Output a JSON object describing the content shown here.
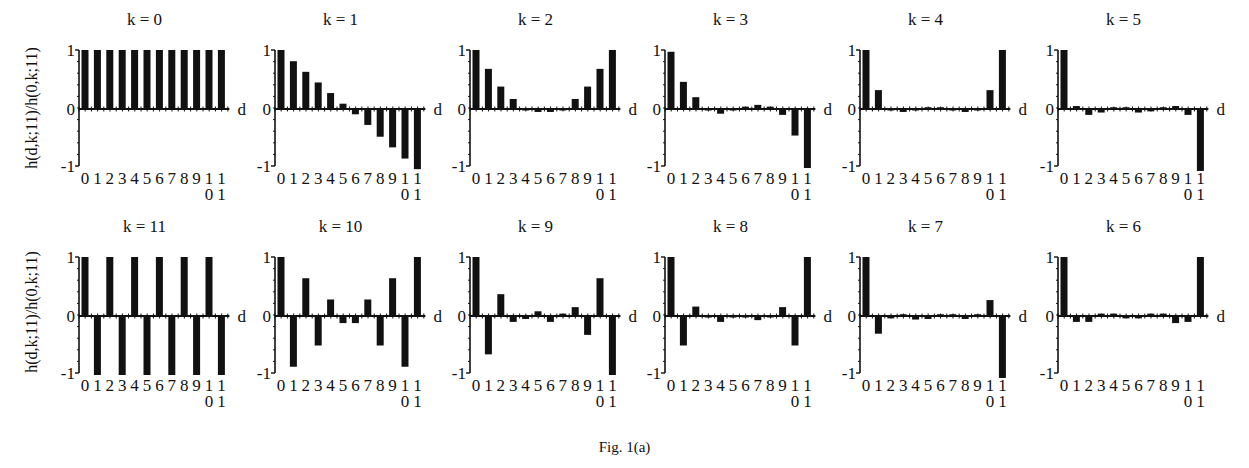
{
  "figure": {
    "caption": "Fig. 1(a)",
    "ylabel": "h(d,k;11)/h(0,k;11)",
    "xlabel": "d",
    "ytick_labels": [
      "1",
      "0",
      "-1"
    ],
    "xtick_line1": "0123456789",
    "xtick_tail_top": "11",
    "xtick_tail_bottom": "01"
  },
  "chart_data": [
    {
      "type": "bar",
      "title": "k = 0",
      "x": [
        0,
        1,
        2,
        3,
        4,
        5,
        6,
        7,
        8,
        9,
        10,
        11
      ],
      "values": [
        1,
        1,
        1,
        1,
        1,
        1,
        1,
        1,
        1,
        1,
        1,
        1
      ],
      "xlabel": "d",
      "ylabel": "h(d,k;11)/h(0,k;11)",
      "ylim": [
        -1,
        1
      ]
    },
    {
      "type": "bar",
      "title": "k = 1",
      "x": [
        0,
        1,
        2,
        3,
        4,
        5,
        6,
        7,
        8,
        9,
        10,
        11
      ],
      "values": [
        1,
        0.81,
        0.63,
        0.45,
        0.27,
        0.09,
        -0.09,
        -0.27,
        -0.47,
        -0.65,
        -0.84,
        -1.02
      ],
      "xlabel": "d",
      "ylim": [
        -1,
        1
      ]
    },
    {
      "type": "bar",
      "title": "k = 2",
      "x": [
        0,
        1,
        2,
        3,
        4,
        5,
        6,
        7,
        8,
        9,
        10,
        11
      ],
      "values": [
        1,
        0.68,
        0.38,
        0.17,
        0,
        -0.05,
        -0.05,
        0,
        0.17,
        0.38,
        0.68,
        1
      ],
      "xlabel": "d",
      "ylim": [
        -1,
        1
      ]
    },
    {
      "type": "bar",
      "title": "k = 3",
      "x": [
        0,
        1,
        2,
        3,
        4,
        5,
        6,
        7,
        8,
        9,
        10,
        11
      ],
      "values": [
        0.97,
        0.46,
        0.2,
        0,
        -0.08,
        0,
        0.04,
        0.07,
        0.04,
        -0.1,
        -0.45,
        -1
      ],
      "xlabel": "d",
      "ylim": [
        -1,
        1
      ]
    },
    {
      "type": "bar",
      "title": "k = 4",
      "x": [
        0,
        1,
        2,
        3,
        4,
        5,
        6,
        7,
        8,
        9,
        10,
        11
      ],
      "values": [
        1,
        0.32,
        0,
        -0.05,
        0,
        0.03,
        0.03,
        0,
        -0.05,
        0,
        0.32,
        1
      ],
      "xlabel": "d",
      "ylim": [
        -1,
        1
      ]
    },
    {
      "type": "bar",
      "title": "k = 5",
      "x": [
        0,
        1,
        2,
        3,
        4,
        5,
        6,
        7,
        8,
        9,
        10,
        11
      ],
      "values": [
        1,
        0.05,
        -0.1,
        -0.06,
        0.03,
        0.03,
        -0.06,
        -0.04,
        0.03,
        0.05,
        -0.1,
        -1.05
      ],
      "xlabel": "d",
      "ylim": [
        -1,
        1
      ]
    },
    {
      "type": "bar",
      "title": "k = 11",
      "x": [
        0,
        1,
        2,
        3,
        4,
        5,
        6,
        7,
        8,
        9,
        10,
        11
      ],
      "values": [
        1,
        -1,
        1,
        -1,
        1,
        -1,
        1,
        -1,
        1,
        -1,
        1,
        -1
      ],
      "xlabel": "d",
      "ylabel": "h(d,k;11)/h(0,k;11)",
      "ylim": [
        -1,
        1
      ]
    },
    {
      "type": "bar",
      "title": "k = 10",
      "x": [
        0,
        1,
        2,
        3,
        4,
        5,
        6,
        7,
        8,
        9,
        10,
        11
      ],
      "values": [
        1,
        -0.86,
        0.64,
        -0.5,
        0.28,
        -0.12,
        -0.12,
        0.28,
        -0.5,
        0.64,
        -0.86,
        1
      ],
      "xlabel": "d",
      "ylim": [
        -1,
        1
      ]
    },
    {
      "type": "bar",
      "title": "k = 9",
      "x": [
        0,
        1,
        2,
        3,
        4,
        5,
        6,
        7,
        8,
        9,
        10,
        11
      ],
      "values": [
        1,
        -0.65,
        0.37,
        -0.1,
        -0.05,
        0.08,
        -0.1,
        0.04,
        0.15,
        -0.32,
        0.64,
        -1
      ],
      "xlabel": "d",
      "ylim": [
        -1,
        1
      ]
    },
    {
      "type": "bar",
      "title": "k = 8",
      "x": [
        0,
        1,
        2,
        3,
        4,
        5,
        6,
        7,
        8,
        9,
        10,
        11
      ],
      "values": [
        1,
        -0.5,
        0.16,
        0,
        -0.1,
        0,
        0,
        -0.07,
        0,
        0.15,
        -0.5,
        1
      ],
      "xlabel": "d",
      "ylim": [
        -1,
        1
      ]
    },
    {
      "type": "bar",
      "title": "k = 7",
      "x": [
        0,
        1,
        2,
        3,
        4,
        5,
        6,
        7,
        8,
        9,
        10,
        11
      ],
      "values": [
        1,
        -0.3,
        -0.04,
        0.03,
        -0.06,
        -0.05,
        0.03,
        0.03,
        -0.05,
        0.03,
        0.27,
        -1.05
      ],
      "xlabel": "d",
      "ylim": [
        -1,
        1
      ]
    },
    {
      "type": "bar",
      "title": "k = 6",
      "x": [
        0,
        1,
        2,
        3,
        4,
        5,
        6,
        7,
        8,
        9,
        10,
        11
      ],
      "values": [
        1,
        -0.1,
        -0.1,
        0.04,
        0.04,
        -0.04,
        -0.04,
        0.04,
        0.04,
        -0.12,
        -0.1,
        1
      ],
      "xlabel": "d",
      "ylim": [
        -1,
        1
      ]
    }
  ]
}
